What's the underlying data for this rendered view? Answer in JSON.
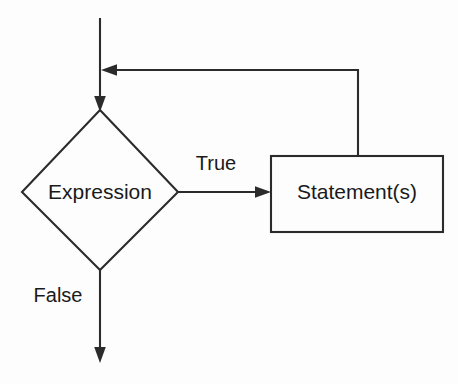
{
  "diagram": {
    "background_color": "#fdfdfd",
    "line_color": "#2b2b2b",
    "text_color": "#1a1a1a",
    "nodes": [
      {
        "id": "expression",
        "shape": "diamond",
        "label": "Expression"
      },
      {
        "id": "statements",
        "shape": "rectangle",
        "label": "Statement(s)"
      }
    ],
    "edges": [
      {
        "id": "entry",
        "from": "",
        "to": "expression",
        "label": "",
        "direction": "down"
      },
      {
        "id": "true-branch",
        "from": "expression",
        "to": "statements",
        "label": "True",
        "direction": "right"
      },
      {
        "id": "false-branch",
        "from": "expression",
        "to": "",
        "label": "False",
        "direction": "down"
      },
      {
        "id": "loop-back",
        "from": "statements",
        "to": "entry",
        "label": "",
        "direction": "left"
      }
    ]
  }
}
